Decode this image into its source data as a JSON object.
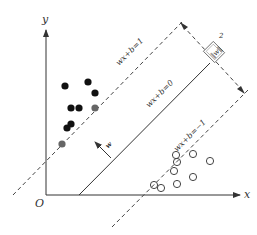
{
  "figure": {
    "axes": {
      "x_label": "x",
      "y_label": "y",
      "origin_label": "O"
    },
    "lines": {
      "upper_margin": "wx+b=1",
      "hyperplane": "wx+b=0",
      "lower_margin": "wx+b=−1"
    },
    "normal_vector_label": "w",
    "margin_label": {
      "numerator": "2",
      "denominator": "‖w‖"
    },
    "colors": {
      "ink": "#333333",
      "filled_point": "#111111",
      "support_vector_filled": "#666666",
      "open_point_stroke": "#444444"
    },
    "filled_points": [
      [
        65,
        86
      ],
      [
        88,
        82
      ],
      [
        95,
        93
      ],
      [
        71,
        108
      ],
      [
        79,
        108
      ],
      [
        67,
        128
      ],
      [
        71,
        124
      ]
    ],
    "filled_support_vectors": [
      [
        95,
        108
      ],
      [
        62,
        144
      ]
    ],
    "open_points": [
      [
        176,
        155
      ],
      [
        193,
        154
      ],
      [
        210,
        161
      ],
      [
        177,
        162
      ],
      [
        174,
        171
      ],
      [
        193,
        177
      ],
      [
        177,
        184
      ],
      [
        154,
        185
      ],
      [
        161,
        188
      ]
    ]
  }
}
